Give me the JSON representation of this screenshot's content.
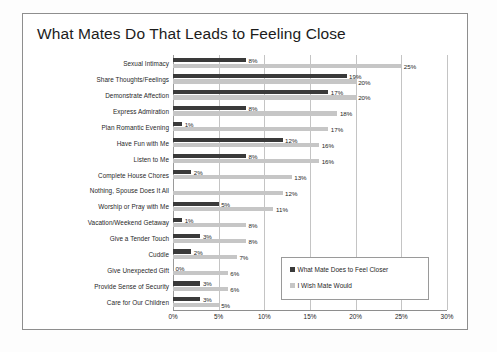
{
  "chart_data": {
    "type": "bar",
    "orientation": "horizontal",
    "title": "What Mates Do That Leads to Feeling Close",
    "xlabel": "",
    "ylabel": "",
    "xlim": [
      0,
      30
    ],
    "xticks": [
      "0%",
      "5%",
      "10%",
      "15%",
      "20%",
      "25%",
      "30%"
    ],
    "xtick_values": [
      0,
      5,
      10,
      15,
      20,
      25,
      30
    ],
    "grid": true,
    "legend_position": "bottom-right",
    "categories": [
      "Sexual Intimacy",
      "Share Thoughts/Feelings",
      "Demonstrate Affection",
      "Express Admiration",
      "Plan Romantic Evening",
      "Have Fun with Me",
      "Listen to Me",
      "Complete House Chores",
      "Nothing, Spouse Does It All",
      "Worship or Pray with Me",
      "Vacation/Weekend Getaway",
      "Give a Tender Touch",
      "Cuddle",
      "Give Unexpected Gift",
      "Provide Sense of Security",
      "Care for Our Children"
    ],
    "series": [
      {
        "name": "What Mate Does to Feel Closer",
        "color": "#3a3a3a",
        "values": [
          8,
          19,
          17,
          8,
          1,
          12,
          8,
          2,
          0,
          5,
          1,
          3,
          2,
          0,
          3,
          3
        ],
        "labels": [
          "8%",
          "19%",
          "17%",
          "8%",
          "1%",
          "12%",
          "8%",
          "2%",
          "",
          "5%",
          "1%",
          "3%",
          "2%",
          "0%",
          "3%",
          "3%"
        ]
      },
      {
        "name": "I Wish Mate Would",
        "color": "#c6c6c6",
        "values": [
          25,
          20,
          20,
          18,
          17,
          16,
          16,
          13,
          12,
          11,
          8,
          8,
          7,
          6,
          6,
          5
        ],
        "labels": [
          "25%",
          "20%",
          "20%",
          "18%",
          "17%",
          "16%",
          "16%",
          "13%",
          "12%",
          "11%",
          "8%",
          "8%",
          "7%",
          "6%",
          "6%",
          "5%"
        ]
      }
    ]
  },
  "colors": {
    "series_dark": "#3a3a3a",
    "series_light": "#c6c6c6",
    "frame": "#8e8e8e",
    "grid": "#c4c4c4",
    "text": "#1f1f1f"
  }
}
